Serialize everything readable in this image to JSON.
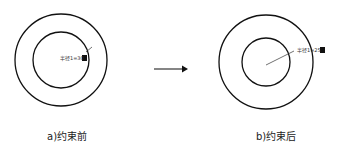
{
  "figure": {
    "panels": [
      {
        "id": "a",
        "caption": "a)约束前",
        "dimension_label": "半径1=30",
        "outer_circle": {
          "cx": 61,
          "cy": 60,
          "r": 46
        },
        "inner_circle": {
          "cx": 61,
          "cy": 60,
          "r": 28
        }
      },
      {
        "id": "b",
        "caption": "b)约束后",
        "dimension_label": "半径1=25",
        "outer_circle": {
          "cx": 266,
          "cy": 62,
          "r": 47
        },
        "inner_circle": {
          "cx": 266,
          "cy": 62,
          "r": 24
        }
      }
    ],
    "arrow": {
      "direction": "right"
    },
    "colors": {
      "stroke": "#111111",
      "background": "#ffffff"
    }
  }
}
